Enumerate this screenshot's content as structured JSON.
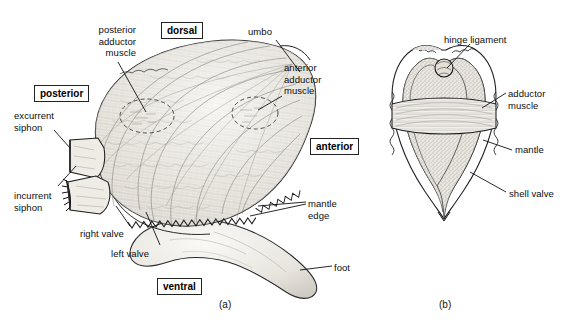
{
  "figure": {
    "background_color": "#ffffff",
    "ink_color": "#1a1a1a",
    "shell_fill": "#f2f0ec",
    "mantle_fill": "#d8d4cc",
    "muscle_fill": "#ebe8e2"
  },
  "panels": [
    {
      "id": "a",
      "caption": "(a)"
    },
    {
      "id": "b",
      "caption": "(b)"
    }
  ],
  "orientation_labels": [
    {
      "name": "dorsal",
      "text": "dorsal",
      "x": 161,
      "y": 22
    },
    {
      "name": "posterior",
      "text": "posterior",
      "x": 34,
      "y": 85
    },
    {
      "name": "anterior",
      "text": "anterior",
      "x": 310,
      "y": 138
    },
    {
      "name": "ventral",
      "text": "ventral",
      "x": 157,
      "y": 278
    }
  ],
  "panel_a_labels": [
    {
      "name": "posterior-adductor-muscle",
      "text": "posterior\nadductor\nmuscle",
      "x": 58,
      "y": 24,
      "align": "right",
      "width": 78
    },
    {
      "name": "umbo",
      "text": "umbo",
      "x": 248,
      "y": 26,
      "align": "left",
      "width": 40
    },
    {
      "name": "anterior-adductor-muscle",
      "text": "anterior\nadductor\nmuscle",
      "x": 284,
      "y": 62,
      "align": "left",
      "width": 60
    },
    {
      "name": "excurrent-siphon",
      "text": "excurrent\nsiphon",
      "x": 14,
      "y": 110,
      "align": "left",
      "width": 62
    },
    {
      "name": "incurrent-siphon",
      "text": "incurrent\nsiphon",
      "x": 14,
      "y": 190,
      "align": "left",
      "width": 62
    },
    {
      "name": "right-valve",
      "text": "right valve",
      "x": 80,
      "y": 228,
      "align": "left",
      "width": 60
    },
    {
      "name": "left-valve",
      "text": "left valve",
      "x": 111,
      "y": 248,
      "align": "left",
      "width": 56
    },
    {
      "name": "mantle-edge",
      "text": "mantle\nedge",
      "x": 308,
      "y": 198,
      "align": "left",
      "width": 46
    },
    {
      "name": "foot",
      "text": "foot",
      "x": 334,
      "y": 262,
      "align": "left",
      "width": 32
    }
  ],
  "panel_b_labels": [
    {
      "name": "hinge-ligament",
      "text": "hinge ligament",
      "x": 444,
      "y": 34,
      "align": "left",
      "width": 80
    },
    {
      "name": "adductor-muscle",
      "text": "adductor\nmuscle",
      "x": 508,
      "y": 88,
      "align": "left",
      "width": 56
    },
    {
      "name": "mantle",
      "text": "mantle",
      "x": 515,
      "y": 144,
      "align": "left",
      "width": 46
    },
    {
      "name": "shell-valve",
      "text": "shell valve",
      "x": 509,
      "y": 188,
      "align": "left",
      "width": 62
    }
  ],
  "structures": {
    "panel_a": [
      "left shell valve (oval, ribbed with concentric growth lines)",
      "right valve edge",
      "excurrent siphon tube",
      "incurrent siphon tube with fringed papillae",
      "crenulated mantle edge along ventral shell margin",
      "muscular foot protruding ventrally",
      "dashed circle marking posterior adductor muscle scar",
      "dashed circle marking anterior adductor muscle scar",
      "umbo at dorsal-anterior beak"
    ],
    "panel_b": [
      "transverse cross-section through both shell valves",
      "hinge ligament at dorsal apex",
      "adductor muscle band spanning valves",
      "stippled mantle lining inside each valve",
      "scalloped shell valve outline"
    ]
  }
}
